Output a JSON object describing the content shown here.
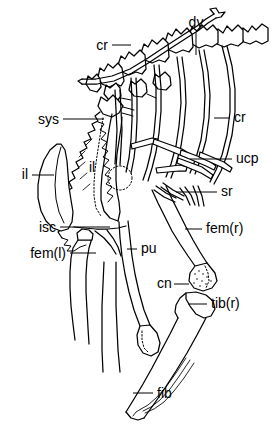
{
  "figure": {
    "kind": "anatomical-line-drawing",
    "ink_color": "#000000",
    "background_color": "#ffffff",
    "width": 272,
    "height": 438
  },
  "labels": [
    {
      "id": "dv",
      "text": "dv",
      "x": 196,
      "y": 27,
      "anchor": "middle",
      "leader": "vertical-down"
    },
    {
      "id": "cr_top",
      "text": "cr",
      "x": 108,
      "y": 50,
      "anchor": "end",
      "leader": "horizontal-right"
    },
    {
      "id": "cr_right",
      "text": "cr",
      "x": 234,
      "y": 122,
      "anchor": "start",
      "leader": "horizontal-left"
    },
    {
      "id": "ucp",
      "text": "ucp",
      "x": 236,
      "y": 163,
      "anchor": "start",
      "leader": "horizontal-left"
    },
    {
      "id": "sr",
      "text": "sr",
      "x": 221,
      "y": 196,
      "anchor": "start",
      "leader": "horizontal-left"
    },
    {
      "id": "sys",
      "text": "sys",
      "x": 59,
      "y": 124,
      "anchor": "end",
      "leader": "horizontal-right"
    },
    {
      "id": "il_left",
      "text": "il",
      "x": 28,
      "y": 179,
      "anchor": "end",
      "leader": "horizontal-right"
    },
    {
      "id": "il_mid",
      "text": "il",
      "x": 92,
      "y": 172,
      "anchor": "middle",
      "leader": "none"
    },
    {
      "id": "isc",
      "text": "isc",
      "x": 56,
      "y": 232,
      "anchor": "end",
      "leader": "horizontal-right"
    },
    {
      "id": "fem_l",
      "text": "fem(l)",
      "x": 66,
      "y": 258,
      "anchor": "end",
      "leader": "horizontal-right"
    },
    {
      "id": "pu",
      "text": "pu",
      "x": 141,
      "y": 253,
      "anchor": "start",
      "leader": "horizontal-left"
    },
    {
      "id": "fem_r",
      "text": "fem(r)",
      "x": 206,
      "y": 233,
      "anchor": "start",
      "leader": "horizontal-left"
    },
    {
      "id": "cn",
      "text": "cn",
      "x": 157,
      "y": 288,
      "anchor": "start",
      "leader": "horizontal-right"
    },
    {
      "id": "tib_r",
      "text": "tib(r)",
      "x": 211,
      "y": 308,
      "anchor": "start",
      "leader": "horizontal-left"
    },
    {
      "id": "fib",
      "text": "fib",
      "x": 157,
      "y": 398,
      "anchor": "start",
      "leader": "horizontal-left"
    }
  ],
  "legend_expansions": {
    "dv": "dorsal vertebra",
    "cr": "cervical / costal rib",
    "ucp": "uncinate process",
    "sr": "sternal rib",
    "sys": "synsacrum",
    "il": "ilium",
    "isc": "ischium",
    "pu": "pubis",
    "fem(l)": "femur (left)",
    "fem(r)": "femur (right)",
    "cn": "cnemial crest",
    "tib(r)": "tibiotarsus (right)",
    "fib": "fibula"
  }
}
